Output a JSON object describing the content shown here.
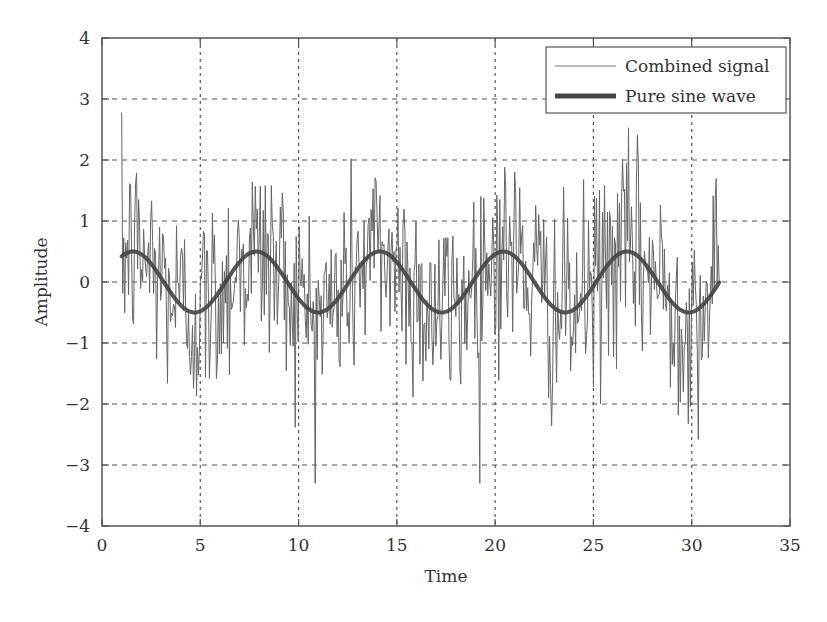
{
  "chart_data": {
    "type": "line",
    "title": "",
    "xlabel": "Time",
    "ylabel": "Amplitude",
    "xlim": [
      0,
      35
    ],
    "ylim": [
      -4,
      4
    ],
    "xticks": [
      0,
      5,
      10,
      15,
      20,
      25,
      30,
      35
    ],
    "yticks": [
      -4,
      -3,
      -2,
      -1,
      0,
      1,
      2,
      3,
      4
    ],
    "xtick_labels": [
      "0",
      "5",
      "10",
      "15",
      "20",
      "25",
      "30",
      "35"
    ],
    "ytick_labels": [
      "−4",
      "−3",
      "−2",
      "−1",
      "0",
      "1",
      "2",
      "3",
      "4"
    ],
    "grid": true,
    "legend_position": "upper right",
    "series": [
      {
        "name": "Combined signal",
        "description": "0.5*sin(t) plus random noise (approx. std 1, peaks to about ±3.3)",
        "t_start": 1.0,
        "t_end": 31.4,
        "points": 600,
        "noise_std": 0.85,
        "color": "#666666",
        "line_width": 1
      },
      {
        "name": "Pure sine wave",
        "expression": "0.5*sin(t)",
        "amplitude": 0.5,
        "t_start": 1.0,
        "t_end": 31.4,
        "peaks_at": [
          1.57,
          7.85,
          14.14,
          20.42,
          26.7
        ],
        "troughs_at": [
          4.71,
          11.0,
          17.28,
          23.56,
          29.85
        ],
        "color": "#444444",
        "line_width": 4
      }
    ]
  },
  "legend": {
    "items": [
      "Combined signal",
      "Pure sine wave"
    ]
  },
  "axes": {
    "xlabel": "Time",
    "ylabel": "Amplitude"
  }
}
